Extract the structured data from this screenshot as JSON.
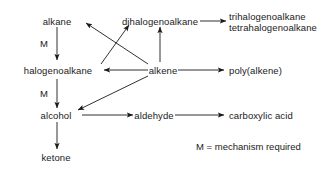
{
  "diagram": {
    "stroke_color": "#1a1a1a",
    "background_color": "#ffffff",
    "nodes": {
      "alkane": "alkane",
      "halogenoalkane": "halogenoalkane",
      "dihalogenoalkane": "dihalogenoalkane",
      "trihalogenoalkane": "trihalogenoalkane",
      "tetrahalogenoalkane": "tetrahalogenoalkane",
      "alkene": "alkene",
      "poly_alkene": "poly(alkene)",
      "alcohol": "alcohol",
      "aldehyde": "aldehyde",
      "carboxylic_acid": "carboxylic acid",
      "ketone": "ketone"
    },
    "edge_labels": {
      "alkane_to_halogenoalkane": "M",
      "halogenoalkane_to_alcohol": "M"
    },
    "legend": {
      "text": "M = mechanism required"
    },
    "edges": [
      {
        "from": "alkane",
        "to": "halogenoalkane",
        "label": "M"
      },
      {
        "from": "halogenoalkane",
        "to": "alcohol",
        "label": "M"
      },
      {
        "from": "halogenoalkane",
        "to": "dihalogenoalkane",
        "label": ""
      },
      {
        "from": "alkene",
        "to": "alkane",
        "label": ""
      },
      {
        "from": "alkene",
        "to": "halogenoalkane",
        "label": ""
      },
      {
        "from": "alkene",
        "to": "dihalogenoalkane",
        "label": ""
      },
      {
        "from": "alkene",
        "to": "alcohol",
        "label": ""
      },
      {
        "from": "alkene",
        "to": "poly_alkene",
        "label": ""
      },
      {
        "from": "dihalogenoalkane",
        "to": "trihalogenoalkane",
        "label": ""
      },
      {
        "from": "alcohol",
        "to": "aldehyde",
        "label": ""
      },
      {
        "from": "alcohol",
        "to": "ketone",
        "label": ""
      },
      {
        "from": "aldehyde",
        "to": "carboxylic_acid",
        "label": ""
      }
    ]
  }
}
